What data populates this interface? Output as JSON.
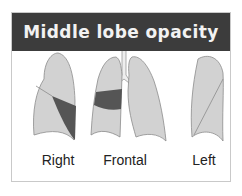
{
  "title": "Middle lobe opacity",
  "colors": {
    "header_bg": "#3c3c3c",
    "header_text": "#f2f2f2",
    "lung_fill": "#d2d2d2",
    "lung_stroke": "#8c8c8c",
    "opacity_fill": "#555555"
  },
  "views": [
    {
      "label": "Right",
      "icon": "right-lateral-lung-icon"
    },
    {
      "label": "Frontal",
      "icon": "frontal-lungs-icon"
    },
    {
      "label": "Left",
      "icon": "left-lateral-lung-icon"
    }
  ]
}
